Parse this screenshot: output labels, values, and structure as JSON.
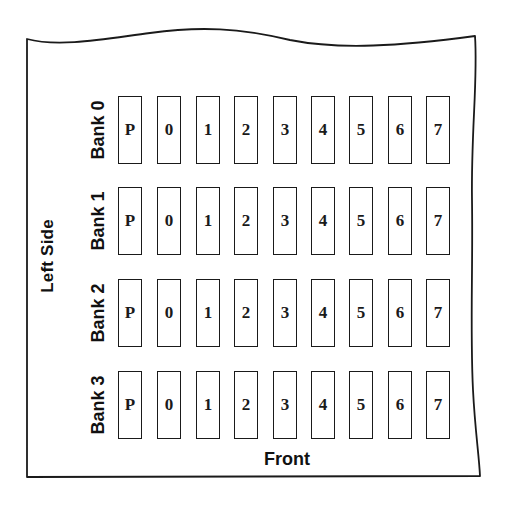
{
  "diagram": {
    "side_label": "Left Side",
    "front_label": "Front",
    "line_color": "#1a1a1a",
    "banks": [
      {
        "label": "Bank 0",
        "chips": [
          "P",
          "0",
          "1",
          "2",
          "3",
          "4",
          "5",
          "6",
          "7"
        ]
      },
      {
        "label": "Bank 1",
        "chips": [
          "P",
          "0",
          "1",
          "2",
          "3",
          "4",
          "5",
          "6",
          "7"
        ]
      },
      {
        "label": "Bank 2",
        "chips": [
          "P",
          "0",
          "1",
          "2",
          "3",
          "4",
          "5",
          "6",
          "7"
        ]
      },
      {
        "label": "Bank 3",
        "chips": [
          "P",
          "0",
          "1",
          "2",
          "3",
          "4",
          "5",
          "6",
          "7"
        ]
      }
    ]
  }
}
